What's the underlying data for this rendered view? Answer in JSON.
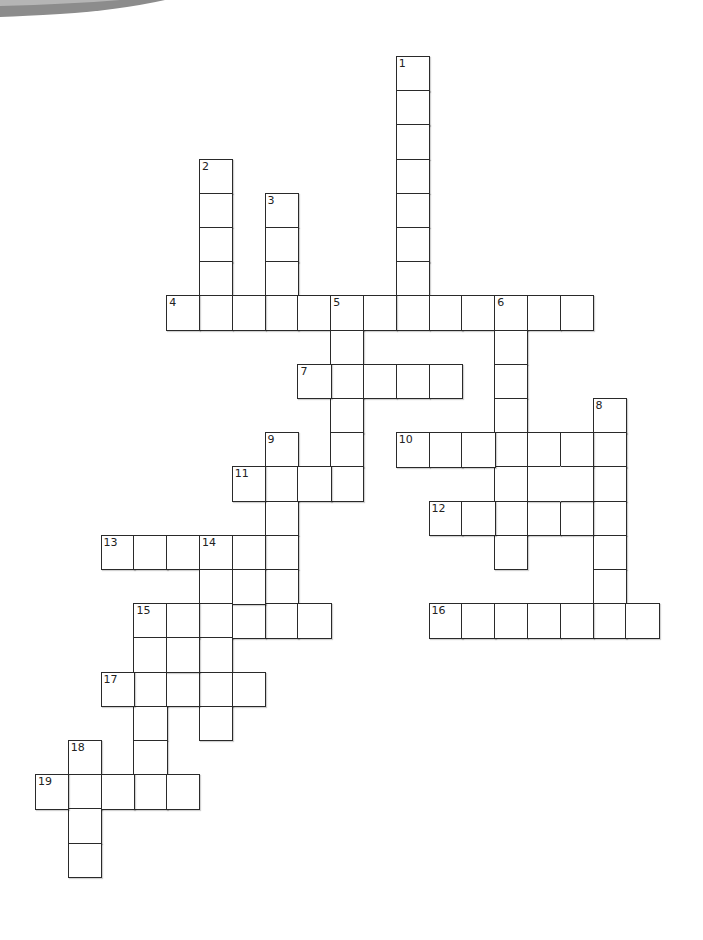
{
  "puzzle": {
    "type": "crossword",
    "grid": {
      "origin_x": 35,
      "origin_y": 56,
      "cell_w": 32.8,
      "cell_h": 34.2,
      "line_color": "#2a2a2a"
    },
    "entries": [
      {
        "number": "1",
        "dir": "down",
        "row": 0,
        "col": 11,
        "length": 8
      },
      {
        "number": "2",
        "dir": "down",
        "row": 3,
        "col": 5,
        "length": 5
      },
      {
        "number": "3",
        "dir": "down",
        "row": 4,
        "col": 7,
        "length": 4
      },
      {
        "number": "4",
        "dir": "across",
        "row": 7,
        "col": 4,
        "length": 13
      },
      {
        "number": "5",
        "dir": "down",
        "row": 7,
        "col": 9,
        "length": 6
      },
      {
        "number": "6",
        "dir": "down",
        "row": 7,
        "col": 14,
        "length": 8
      },
      {
        "number": "7",
        "dir": "across",
        "row": 9,
        "col": 8,
        "length": 5
      },
      {
        "number": "8",
        "dir": "down",
        "row": 10,
        "col": 17,
        "length": 7
      },
      {
        "number": "9",
        "dir": "down",
        "row": 11,
        "col": 7,
        "length": 6
      },
      {
        "number": "10",
        "dir": "across",
        "row": 11,
        "col": 11,
        "length": 7
      },
      {
        "number": "11",
        "dir": "across",
        "row": 12,
        "col": 6,
        "length": 4
      },
      {
        "number": "12",
        "dir": "across",
        "row": 13,
        "col": 12,
        "length": 6
      },
      {
        "number": "13",
        "dir": "across",
        "row": 14,
        "col": 2,
        "length": 6
      },
      {
        "number": "14",
        "dir": "down",
        "row": 14,
        "col": 5,
        "length": 6
      },
      {
        "number": "15",
        "dir": "across",
        "row": 16,
        "col": 3,
        "length": 6
      },
      {
        "number": "15",
        "dir": "down",
        "row": 16,
        "col": 3,
        "length": 6
      },
      {
        "number": "16",
        "dir": "across",
        "row": 16,
        "col": 12,
        "length": 7
      },
      {
        "number": "17",
        "dir": "across",
        "row": 18,
        "col": 2,
        "length": 5
      },
      {
        "number": "18",
        "dir": "down",
        "row": 20,
        "col": 1,
        "length": 4
      },
      {
        "number": "19",
        "dir": "across",
        "row": 21,
        "col": 0,
        "length": 5
      }
    ],
    "extra_cells": [
      {
        "row": 12,
        "col": 15,
        "merge_right": true
      },
      {
        "row": 12,
        "col": 16,
        "merge_left": true
      },
      {
        "row": 15,
        "col": 6
      },
      {
        "row": 17,
        "col": 4
      }
    ],
    "decoration": {
      "corner_arc_color": "#8a8a8a"
    }
  }
}
